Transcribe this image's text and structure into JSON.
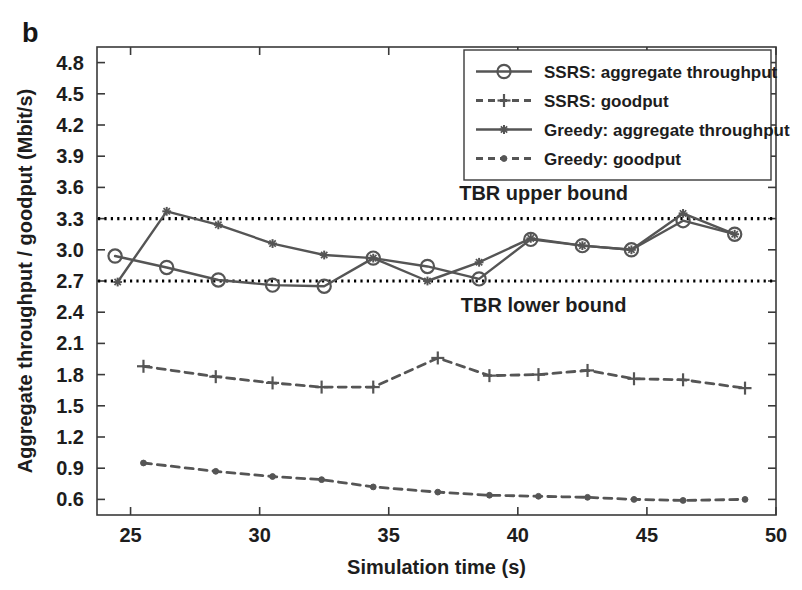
{
  "figure": {
    "panel_label": "b",
    "width": 802,
    "height": 590
  },
  "chart_data": {
    "type": "line",
    "title": "",
    "xlabel": "Simulation time (s)",
    "ylabel": "Aggregate throughput / goodput (Mbit/s)",
    "xlim": [
      23.7,
      50.0
    ],
    "ylim": [
      0.45,
      4.95
    ],
    "xticks": [
      25,
      30,
      35,
      40,
      45,
      50
    ],
    "yticks": [
      0.6,
      0.9,
      1.2,
      1.5,
      1.8,
      2.1,
      2.4,
      2.7,
      3.0,
      3.3,
      3.6,
      3.9,
      4.2,
      4.5,
      4.8
    ],
    "xtick_labels": [
      "25",
      "30",
      "35",
      "40",
      "45",
      "50"
    ],
    "ytick_labels": [
      "0.6",
      "0.9",
      "1.2",
      "1.5",
      "1.8",
      "2.1",
      "2.4",
      "2.7",
      "3.0",
      "3.3",
      "3.6",
      "3.9",
      "4.2",
      "4.5",
      "4.8"
    ],
    "grid": false,
    "legend_position": "top-right",
    "series": [
      {
        "name": "SSRS: aggregate throughput",
        "marker": "circle",
        "linestyle": "solid",
        "color": "#555555",
        "x": [
          24.4,
          26.4,
          28.4,
          30.5,
          32.5,
          34.4,
          36.5,
          38.5,
          40.5,
          42.5,
          44.4,
          46.4,
          48.4
        ],
        "y": [
          2.94,
          2.83,
          2.71,
          2.66,
          2.65,
          2.92,
          2.84,
          2.72,
          3.1,
          3.04,
          3.0,
          3.28,
          3.15
        ]
      },
      {
        "name": "SSRS: goodput",
        "marker": "plus",
        "linestyle": "dashed",
        "color": "#555555",
        "x": [
          25.5,
          28.3,
          30.5,
          32.4,
          34.4,
          36.9,
          38.9,
          40.8,
          42.7,
          44.5,
          46.4,
          48.8
        ],
        "y": [
          1.88,
          1.78,
          1.72,
          1.68,
          1.68,
          1.96,
          1.79,
          1.8,
          1.84,
          1.76,
          1.75,
          1.67
        ]
      },
      {
        "name": "Greedy: aggregate throughput",
        "marker": "asterisk",
        "linestyle": "solid",
        "color": "#555555",
        "x": [
          24.5,
          26.4,
          28.4,
          30.5,
          32.5,
          34.4,
          36.5,
          38.5,
          40.5,
          42.5,
          44.4,
          46.4,
          48.4
        ],
        "y": [
          2.69,
          3.37,
          3.24,
          3.06,
          2.95,
          2.92,
          2.7,
          2.88,
          3.11,
          3.04,
          3.0,
          3.35,
          3.15
        ]
      },
      {
        "name": "Greedy: goodput",
        "marker": "dot",
        "linestyle": "dashed",
        "color": "#555555",
        "x": [
          25.5,
          28.3,
          30.5,
          32.4,
          34.4,
          36.9,
          38.9,
          40.8,
          42.7,
          44.5,
          46.4,
          48.8
        ],
        "y": [
          0.95,
          0.87,
          0.82,
          0.79,
          0.72,
          0.67,
          0.64,
          0.63,
          0.62,
          0.6,
          0.59,
          0.6
        ]
      }
    ],
    "reference_lines": [
      {
        "label": "TBR upper bound",
        "value": 3.3,
        "linestyle": "dotted",
        "color": "#000000"
      },
      {
        "label": "TBR lower bound",
        "value": 2.7,
        "linestyle": "dotted",
        "color": "#000000"
      }
    ],
    "annotations": [
      {
        "text": "TBR upper bound",
        "x": 41.0,
        "y": 3.55
      },
      {
        "text": "TBR lower bound",
        "x": 41.0,
        "y": 2.47
      }
    ]
  },
  "legend": {
    "entries": [
      {
        "label": "SSRS: aggregate throughput",
        "marker": "circle",
        "linestyle": "solid"
      },
      {
        "label": "SSRS: goodput",
        "marker": "plus",
        "linestyle": "dashed"
      },
      {
        "label": "Greedy: aggregate throughput",
        "marker": "asterisk",
        "linestyle": "solid"
      },
      {
        "label": "Greedy: goodput",
        "marker": "dot",
        "linestyle": "dashed"
      }
    ]
  },
  "colors": {
    "line": "#555555",
    "axis": "#3a3a3a",
    "text": "#1d1d1d",
    "background": "#ffffff"
  }
}
